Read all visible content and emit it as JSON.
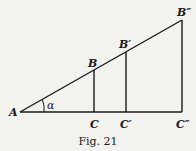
{
  "figure": {
    "caption": "Fig. 21",
    "labels": {
      "A": "A",
      "B": "B",
      "B1": "B′",
      "B2": "B″",
      "C": "C",
      "C1": "C′",
      "C2": "C″",
      "angle": "α"
    },
    "line_color": "#1a1a1a"
  }
}
